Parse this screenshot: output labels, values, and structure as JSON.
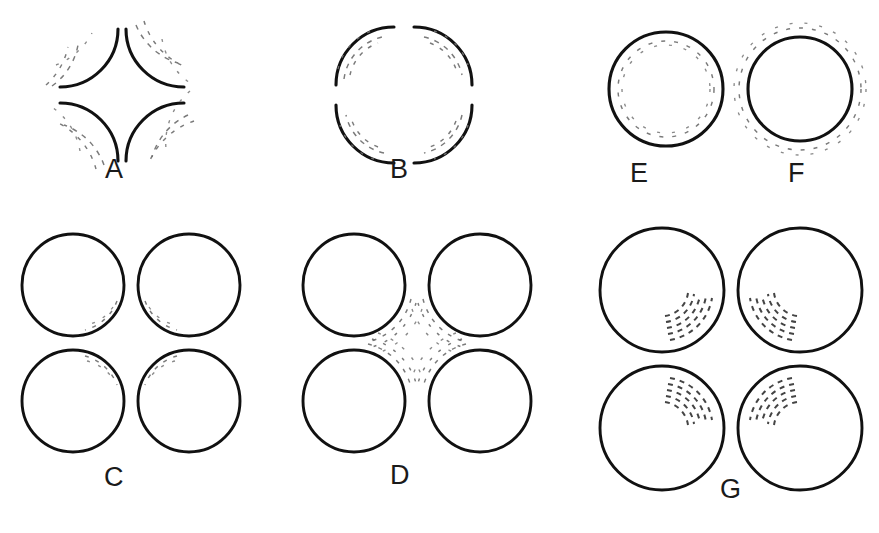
{
  "figure": {
    "background_color": "#ffffff",
    "ink_color": "#111111",
    "faint_mark_color": "#6f6f6f",
    "width": 879,
    "height": 533
  },
  "panels": [
    {
      "id": "A",
      "label": "A",
      "label_x": 113,
      "label_y": 165,
      "description": "Four quarter arcs convex toward centre forming an illusory diamond; faint dashed arcs lie just outside each solid arc.",
      "element_type": "quarter-arcs",
      "arc_count": 4,
      "arc_radius": 58,
      "center_x": 122,
      "center_y": 95,
      "faint_side": "outside",
      "faint_ring_count": 3
    },
    {
      "id": "B",
      "label": "B",
      "label_x": 398,
      "label_y": 165,
      "description": "Four quarter arcs concave toward centre forming an illusory pinched cross; faint dashed arcs lie just inside each solid arc toward the centre.",
      "element_type": "quarter-arcs",
      "arc_count": 4,
      "arc_radius": 58,
      "center_x": 404,
      "center_y": 95,
      "faint_side": "inside",
      "faint_ring_count": 3
    },
    {
      "id": "C",
      "label": "C",
      "label_x": 113,
      "label_y": 464,
      "description": "Four complete circles in a square array; faint concentric dashed arcs sit just inside the rim of each circle on the quadrant facing the centre.",
      "element_type": "circles",
      "circle_count": 4,
      "circle_radius": 51,
      "center_x": 135,
      "center_y": 345,
      "faint_side": "inside",
      "faint_ring_count": 2
    },
    {
      "id": "D",
      "label": "D",
      "label_x": 400,
      "label_y": 462,
      "description": "Four complete circles in a square array; faint concentric dashed arcs sit just outside each circle in the central gap, forming an illusory star shape.",
      "element_type": "circles",
      "circle_count": 4,
      "circle_radius": 51,
      "center_x": 424,
      "center_y": 345,
      "faint_side": "outside",
      "faint_ring_count": 3
    },
    {
      "id": "E",
      "label": "E",
      "label_x": 638,
      "label_y": 162,
      "description": "Single solid circle with a faint dashed ring concentric just inside the outline.",
      "element_type": "circle",
      "circle_count": 1,
      "circle_radius": 57,
      "center_x": 666,
      "center_y": 89,
      "faint_side": "inside",
      "faint_ring_count": 1
    },
    {
      "id": "F",
      "label": "F",
      "label_x": 792,
      "label_y": 162,
      "description": "Single solid circle with a faint dashed ring concentric just outside the outline.",
      "element_type": "circle",
      "circle_count": 1,
      "circle_radius": 52,
      "center_x": 800,
      "center_y": 89,
      "faint_side": "outside",
      "faint_ring_count": 1
    },
    {
      "id": "G",
      "label": "G",
      "label_x": 727,
      "label_y": 478,
      "description": "Four complete circles in a square array; each contains a fan of nested dashed arcs in the quadrant facing the centre of the array.",
      "element_type": "circles",
      "circle_count": 4,
      "circle_radius": 62,
      "center_x": 729,
      "center_y": 355,
      "faint_side": "inside-texture",
      "texture_arc_count": 5
    }
  ]
}
